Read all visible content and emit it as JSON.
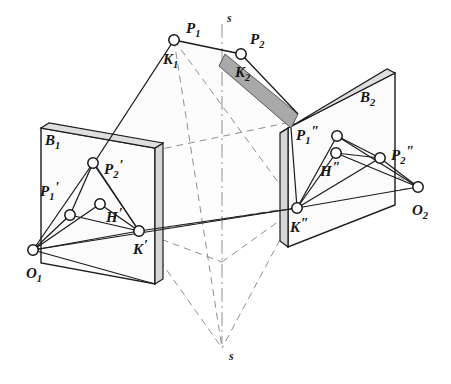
{
  "figure": {
    "background_color": "#ffffff",
    "line_color": "#1b1b1b",
    "plane_fill": "#fbfbfb",
    "plane_edge_fill": "#d9d9d9",
    "band_fill": "#a8a8a8",
    "dash_color": "#8c8c8c"
  },
  "axis": {
    "name": "s",
    "top_label": "s",
    "bottom_label": "s",
    "top_label_pos": {
      "x": 228,
      "y": 20
    },
    "bottom_label_pos": {
      "x": 232,
      "y": 358
    }
  },
  "planes": [
    {
      "id": "B1",
      "label": "B₁",
      "base": "B",
      "sub": "1",
      "label_pos": {
        "x": 45,
        "y": 141
      }
    },
    {
      "id": "B2",
      "label": "B₂",
      "base": "B",
      "sub": "2",
      "label_pos": {
        "x": 362,
        "y": 100
      }
    }
  ],
  "points": [
    {
      "id": "P1",
      "base": "P",
      "sub": "1",
      "prime": "",
      "x": 174,
      "y": 40,
      "label_dx": 10,
      "label_dy": -8,
      "group": "space"
    },
    {
      "id": "P2",
      "base": "P",
      "sub": "2",
      "prime": "",
      "x": 241,
      "y": 54,
      "label_dx": 10,
      "label_dy": -12,
      "group": "space"
    },
    {
      "id": "K1",
      "base": "K",
      "sub": "1",
      "prime": "",
      "x": 174,
      "y": 40,
      "label_dx": -8,
      "label_dy": 22,
      "group": "space",
      "no_dot": true
    },
    {
      "id": "K2",
      "base": "K",
      "sub": "2",
      "prime": "",
      "x": 241,
      "y": 54,
      "label_dx": -6,
      "label_dy": 21,
      "group": "space",
      "no_dot": true
    },
    {
      "id": "P1p",
      "base": "P",
      "sub": "1",
      "prime": "′",
      "x": 70,
      "y": 215,
      "label_dx": -32,
      "label_dy": -22,
      "group": "left-plane"
    },
    {
      "id": "P2p",
      "base": "P",
      "sub": "2",
      "prime": "′",
      "x": 93,
      "y": 163,
      "label_dx": 11,
      "label_dy": 9,
      "group": "left-plane"
    },
    {
      "id": "Hp",
      "base": "H",
      "sub": "",
      "prime": "′",
      "x": 100,
      "y": 204,
      "label_dx": 8,
      "label_dy": 17,
      "group": "left-plane"
    },
    {
      "id": "Kp",
      "base": "K",
      "sub": "",
      "prime": "′",
      "x": 139,
      "y": 231,
      "label_dx": -3,
      "label_dy": 22,
      "group": "left-plane"
    },
    {
      "id": "O1",
      "base": "O",
      "sub": "1",
      "prime": "",
      "x": 33,
      "y": 250,
      "label_dx": -6,
      "label_dy": 27,
      "group": "center"
    },
    {
      "id": "P1pp",
      "base": "P",
      "sub": "1",
      "prime": "″",
      "x": 337,
      "y": 136,
      "label_dx": -40,
      "label_dy": 2,
      "group": "right-plane"
    },
    {
      "id": "Hpp",
      "base": "H",
      "sub": "",
      "prime": "″",
      "x": 336,
      "y": 153,
      "label_dx": -14,
      "label_dy": 22,
      "group": "right-plane"
    },
    {
      "id": "P2pp",
      "base": "P",
      "sub": "2",
      "prime": "″",
      "x": 380,
      "y": 158,
      "label_dx": 12,
      "label_dy": 0,
      "group": "right-plane"
    },
    {
      "id": "Kpp",
      "base": "K",
      "sub": "",
      "prime": "″",
      "x": 297,
      "y": 208,
      "label_dx": -4,
      "label_dy": 23,
      "group": "right-plane"
    },
    {
      "id": "O2",
      "base": "O",
      "sub": "2",
      "prime": "",
      "x": 418,
      "y": 187,
      "label_dx": -3,
      "label_dy": 27,
      "group": "center"
    }
  ],
  "labels": {
    "P1": "P",
    "P2": "P",
    "K1": "K",
    "K2": "K",
    "B1": "B",
    "B2": "B",
    "O1": "O",
    "O2": "O",
    "H": "H",
    "K": "K"
  },
  "legend_note": "Central projection: object points P1, P2 projected from centres O1 and O2 onto image planes B1 and B2; K is the piercing point, H the trace point."
}
